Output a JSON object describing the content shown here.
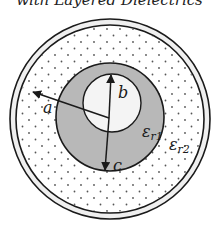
{
  "title": "with Layered Dielectrics",
  "diagram": {
    "labels": {
      "a": "a",
      "b": "b",
      "c": "c",
      "eps1_main": "ε",
      "eps1_sub": "r1",
      "eps2_main": "ε",
      "eps2_sub": "r2"
    },
    "regions": [
      {
        "name": "inner-conductor",
        "fill": "#f4f4f4"
      },
      {
        "name": "dielectric-er1",
        "fill": "#b8b8b8"
      },
      {
        "name": "dielectric-er2",
        "fill": "#ffffff",
        "pattern": "dots"
      },
      {
        "name": "outer-conductor",
        "fill": "#efefef"
      }
    ],
    "colors": {
      "stroke": "#1a1a1a",
      "gray_ring": "#b8b8b8",
      "dots": "#555555"
    }
  }
}
